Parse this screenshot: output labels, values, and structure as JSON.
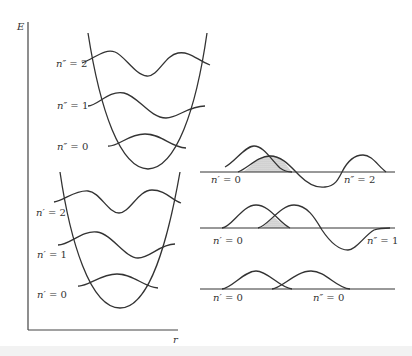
{
  "figure": {
    "axes": {
      "y_label": "E",
      "x_label": "r"
    },
    "upper_well": {
      "name": "ground electronic state",
      "levels": [
        {
          "label": "n″ = 2",
          "prime": "n″",
          "eq": " = ",
          "value": "2"
        },
        {
          "label": "n″ = 1",
          "prime": "n″",
          "eq": " = ",
          "value": "1"
        },
        {
          "label": "n″ = 0",
          "prime": "n″",
          "eq": " = ",
          "value": "0"
        }
      ]
    },
    "lower_well": {
      "name": "excited electronic state",
      "levels": [
        {
          "label": "n′ = 2",
          "prime": "n′",
          "eq": " = ",
          "value": "2"
        },
        {
          "label": "n′ = 1",
          "prime": "n′",
          "eq": " = ",
          "value": "1"
        },
        {
          "label": "n′ = 0",
          "prime": "n′",
          "eq": " = ",
          "value": "0"
        }
      ]
    },
    "overlap_panels": [
      {
        "left_label": {
          "prime": "n′",
          "value": "0"
        },
        "right_label": {
          "prime": "n″",
          "value": "2"
        }
      },
      {
        "left_label": {
          "prime": "n′",
          "value": "0"
        },
        "right_label": {
          "prime": "n″",
          "value": "1"
        }
      },
      {
        "left_label": {
          "prime": "n′",
          "value": "0"
        },
        "right_label": {
          "prime": "n″",
          "value": "0"
        }
      }
    ],
    "colors": {
      "stroke": "#333333",
      "shade": "#c8c8c8",
      "background": "#ffffff"
    }
  }
}
